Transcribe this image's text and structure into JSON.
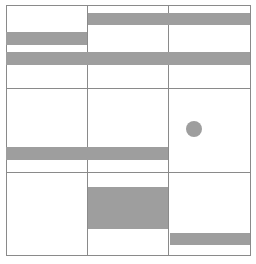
{
  "canvas": {
    "width": 256,
    "height": 264,
    "background": "#ffffff"
  },
  "colors": {
    "grid_line": "#8a8a8a",
    "fill": "#9e9e9e"
  },
  "grid": {
    "frame": {
      "x": 6,
      "y": 5,
      "w": 245,
      "h": 251
    },
    "vertical_lines": [
      {
        "x": 87
      },
      {
        "x": 168
      }
    ],
    "horizontal_lines": [
      {
        "y": 88
      },
      {
        "y": 172
      }
    ],
    "rows": 3,
    "cols": 3
  },
  "shapes": [
    {
      "id": "bar-1",
      "type": "bar",
      "x": 88,
      "y": 13,
      "w": 162,
      "h": 12
    },
    {
      "id": "bar-2",
      "type": "bar",
      "x": 6,
      "y": 32,
      "w": 81,
      "h": 13
    },
    {
      "id": "bar-3",
      "type": "bar",
      "x": 6,
      "y": 52,
      "w": 244,
      "h": 13
    },
    {
      "id": "bar-4",
      "type": "bar",
      "x": 6,
      "y": 147,
      "w": 162,
      "h": 13
    },
    {
      "id": "circle-1",
      "type": "circle",
      "cx": 194,
      "cy": 129,
      "r": 8
    },
    {
      "id": "block-1",
      "type": "rect",
      "x": 88,
      "y": 187,
      "w": 80,
      "h": 42
    },
    {
      "id": "bar-5",
      "type": "bar",
      "x": 170,
      "y": 233,
      "w": 80,
      "h": 12
    }
  ]
}
